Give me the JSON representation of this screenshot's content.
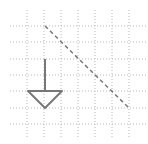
{
  "diagram": {
    "width": 148,
    "height": 144,
    "background": "#ffffff",
    "grid": {
      "color": "#b8b8b8",
      "dash": "1,2",
      "x_lines": [
        27,
        44,
        61,
        78,
        95,
        112,
        129
      ],
      "y_lines": [
        26,
        42,
        59,
        75,
        91,
        108,
        124
      ],
      "x_extent": [
        10,
        146
      ],
      "y_extent": [
        10,
        138
      ]
    },
    "shapes": {
      "stroke_color": "#777777",
      "arrow_shaft": {
        "x1": 45,
        "y1": 59,
        "x2": 45,
        "y2": 91
      },
      "arrow_head": {
        "points": "28,91 62,91 45,108"
      },
      "dashed_line": {
        "x1": 45,
        "y1": 26,
        "x2": 129,
        "y2": 108,
        "dash": "4,3"
      }
    }
  }
}
